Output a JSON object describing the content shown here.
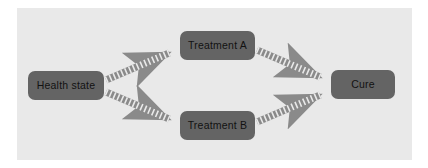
{
  "diagram": {
    "canvas": {
      "width": 428,
      "height": 168
    },
    "panel": {
      "background": "#e9e9e9",
      "x": 17,
      "y": 8,
      "width": 395,
      "height": 152
    },
    "style": {
      "node_fill": "#646464",
      "node_text_color": "#121212",
      "edge_color": "#8a8a8a",
      "edge_dash_color": "#e9e9e9",
      "page_background": "#ffffff"
    },
    "nodes": [
      {
        "id": "health-state",
        "label": "Health state",
        "x": 28,
        "y": 71,
        "width": 76,
        "height": 29
      },
      {
        "id": "treatment-a",
        "label": "Treatment A",
        "x": 180,
        "y": 31,
        "width": 75,
        "height": 29
      },
      {
        "id": "treatment-b",
        "label": "Treatment B",
        "x": 180,
        "y": 111,
        "width": 75,
        "height": 29
      },
      {
        "id": "cure",
        "label": "Cure",
        "x": 331,
        "y": 70,
        "width": 64,
        "height": 29
      }
    ],
    "edges": [
      {
        "id": "health-state-to-treatment-a",
        "from": "health-state",
        "to": "treatment-a",
        "x1": 106,
        "y1": 80,
        "x2": 176,
        "y2": 50,
        "arrowhead": "triangle"
      },
      {
        "id": "health-state-to-treatment-b",
        "from": "health-state",
        "to": "treatment-b",
        "x1": 106,
        "y1": 92,
        "x2": 176,
        "y2": 122,
        "arrowhead": "triangle"
      },
      {
        "id": "treatment-a-to-cure",
        "from": "treatment-a",
        "to": "cure",
        "x1": 257,
        "y1": 50,
        "x2": 327,
        "y2": 80,
        "arrowhead": "triangle"
      },
      {
        "id": "treatment-b-to-cure",
        "from": "treatment-b",
        "to": "cure",
        "x1": 257,
        "y1": 122,
        "x2": 327,
        "y2": 92,
        "arrowhead": "triangle"
      }
    ]
  }
}
